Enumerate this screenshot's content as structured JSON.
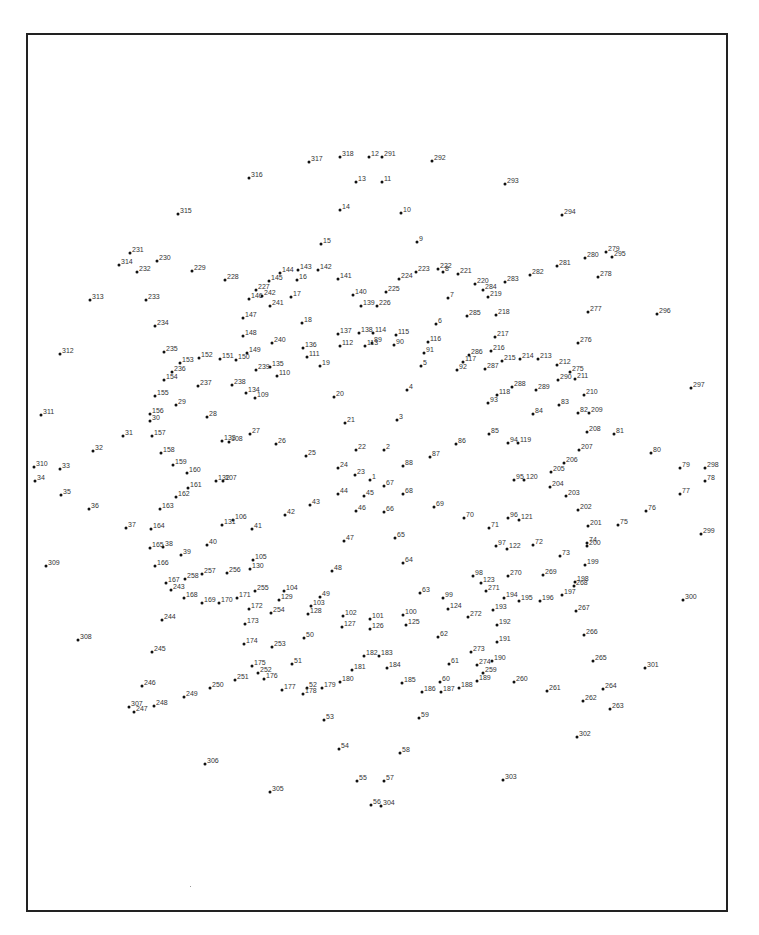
{
  "page": {
    "type": "dot-to-dot puzzle",
    "frame": {
      "left": 26,
      "top": 33,
      "right": 726,
      "bottom": 910
    }
  },
  "points": [
    [
      1,
      370,
      480
    ],
    [
      2,
      384,
      450
    ],
    [
      3,
      397,
      420
    ],
    [
      4,
      407,
      390
    ],
    [
      5,
      421,
      366
    ],
    [
      6,
      436,
      324
    ],
    [
      7,
      448,
      298
    ],
    [
      8,
      443,
      272
    ],
    [
      9,
      417,
      242
    ],
    [
      10,
      401,
      213
    ],
    [
      11,
      382,
      182
    ],
    [
      12,
      369,
      157
    ],
    [
      13,
      356,
      182
    ],
    [
      14,
      340,
      210
    ],
    [
      15,
      321,
      244
    ],
    [
      16,
      297,
      280
    ],
    [
      17,
      291,
      297
    ],
    [
      18,
      302,
      323
    ],
    [
      19,
      320,
      366
    ],
    [
      20,
      334,
      397
    ],
    [
      21,
      345,
      423
    ],
    [
      22,
      356,
      450
    ],
    [
      23,
      355,
      475
    ],
    [
      24,
      338,
      468
    ],
    [
      25,
      306,
      456
    ],
    [
      26,
      276,
      444
    ],
    [
      27,
      250,
      434
    ],
    [
      28,
      207,
      417
    ],
    [
      29,
      176,
      405
    ],
    [
      30,
      150,
      421
    ],
    [
      31,
      123,
      436
    ],
    [
      32,
      93,
      451
    ],
    [
      33,
      60,
      469
    ],
    [
      34,
      35,
      481
    ],
    [
      35,
      61,
      495
    ],
    [
      36,
      89,
      509
    ],
    [
      37,
      126,
      528
    ],
    [
      38,
      163,
      547
    ],
    [
      39,
      181,
      555
    ],
    [
      40,
      207,
      545
    ],
    [
      41,
      252,
      529
    ],
    [
      42,
      285,
      515
    ],
    [
      43,
      310,
      505
    ],
    [
      44,
      338,
      494
    ],
    [
      45,
      364,
      496
    ],
    [
      46,
      356,
      511
    ],
    [
      47,
      344,
      541
    ],
    [
      48,
      332,
      571
    ],
    [
      49,
      320,
      597
    ],
    [
      50,
      304,
      638
    ],
    [
      51,
      292,
      664
    ],
    [
      52,
      307,
      688
    ],
    [
      53,
      324,
      720
    ],
    [
      54,
      339,
      749
    ],
    [
      55,
      357,
      781
    ],
    [
      56,
      371,
      805
    ],
    [
      57,
      384,
      781
    ],
    [
      58,
      400,
      753
    ],
    [
      59,
      419,
      718
    ],
    [
      60,
      440,
      682
    ],
    [
      61,
      449,
      664
    ],
    [
      62,
      438,
      637
    ],
    [
      63,
      420,
      593
    ],
    [
      64,
      403,
      563
    ],
    [
      65,
      395,
      538
    ],
    [
      66,
      384,
      512
    ],
    [
      67,
      384,
      486
    ],
    [
      68,
      403,
      494
    ],
    [
      69,
      434,
      507
    ],
    [
      70,
      464,
      518
    ],
    [
      71,
      489,
      528
    ],
    [
      72,
      533,
      545
    ],
    [
      73,
      560,
      556
    ],
    [
      74,
      587,
      543
    ],
    [
      75,
      618,
      525
    ],
    [
      76,
      646,
      511
    ],
    [
      77,
      680,
      494
    ],
    [
      78,
      705,
      481
    ],
    [
      79,
      680,
      468
    ],
    [
      80,
      651,
      453
    ],
    [
      81,
      614,
      434
    ],
    [
      82,
      578,
      413
    ],
    [
      83,
      559,
      405
    ],
    [
      84,
      533,
      414
    ],
    [
      85,
      489,
      434
    ],
    [
      86,
      456,
      444
    ],
    [
      87,
      430,
      457
    ],
    [
      88,
      403,
      466
    ],
    [
      89,
      372,
      343
    ],
    [
      90,
      394,
      345
    ],
    [
      91,
      424,
      353
    ],
    [
      92,
      457,
      370
    ],
    [
      93,
      488,
      403
    ],
    [
      94,
      508,
      443
    ],
    [
      95,
      514,
      480
    ],
    [
      96,
      508,
      518
    ],
    [
      97,
      496,
      546
    ],
    [
      98,
      473,
      576
    ],
    [
      99,
      443,
      598
    ],
    [
      100,
      403,
      615
    ],
    [
      101,
      370,
      619
    ],
    [
      102,
      343,
      616
    ],
    [
      103,
      311,
      606
    ],
    [
      104,
      284,
      591
    ],
    [
      105,
      253,
      560
    ],
    [
      106,
      233,
      520
    ],
    [
      107,
      223,
      481
    ],
    [
      108,
      229,
      442
    ],
    [
      109,
      255,
      398
    ],
    [
      110,
      277,
      376
    ],
    [
      111,
      307,
      357
    ],
    [
      112,
      340,
      346
    ],
    [
      113,
      365,
      346
    ],
    [
      114,
      373,
      333
    ],
    [
      115,
      396,
      335
    ],
    [
      116,
      428,
      342
    ],
    [
      117,
      463,
      362
    ],
    [
      118,
      497,
      395
    ],
    [
      119,
      518,
      443
    ],
    [
      120,
      524,
      480
    ],
    [
      121,
      519,
      520
    ],
    [
      122,
      507,
      549
    ],
    [
      123,
      481,
      583
    ],
    [
      124,
      448,
      609
    ],
    [
      125,
      406,
      625
    ],
    [
      126,
      370,
      629
    ],
    [
      127,
      342,
      627
    ],
    [
      128,
      308,
      614
    ],
    [
      129,
      279,
      600
    ],
    [
      130,
      250,
      569
    ],
    [
      131,
      222,
      525
    ],
    [
      132,
      216,
      481
    ],
    [
      133,
      222,
      441
    ],
    [
      134,
      246,
      393
    ],
    [
      135,
      270,
      367
    ],
    [
      136,
      303,
      348
    ],
    [
      137,
      338,
      334
    ],
    [
      138,
      359,
      333
    ],
    [
      139,
      361,
      306
    ],
    [
      140,
      353,
      295
    ],
    [
      141,
      338,
      279
    ],
    [
      142,
      318,
      270
    ],
    [
      143,
      298,
      270
    ],
    [
      144,
      280,
      273
    ],
    [
      145,
      269,
      281
    ],
    [
      146,
      249,
      299
    ],
    [
      147,
      243,
      318
    ],
    [
      148,
      243,
      336
    ],
    [
      149,
      247,
      353
    ],
    [
      150,
      236,
      360
    ],
    [
      151,
      220,
      359
    ],
    [
      152,
      199,
      358
    ],
    [
      153,
      180,
      363
    ],
    [
      154,
      164,
      380
    ],
    [
      155,
      155,
      396
    ],
    [
      156,
      150,
      414
    ],
    [
      157,
      152,
      436
    ],
    [
      158,
      161,
      453
    ],
    [
      159,
      173,
      465
    ],
    [
      160,
      187,
      473
    ],
    [
      161,
      188,
      488
    ],
    [
      162,
      176,
      497
    ],
    [
      163,
      160,
      509
    ],
    [
      164,
      151,
      529
    ],
    [
      165,
      150,
      548
    ],
    [
      166,
      155,
      566
    ],
    [
      167,
      166,
      583
    ],
    [
      168,
      184,
      598
    ],
    [
      169,
      202,
      603
    ],
    [
      170,
      219,
      603
    ],
    [
      171,
      237,
      598
    ],
    [
      172,
      249,
      609
    ],
    [
      173,
      245,
      624
    ],
    [
      174,
      244,
      644
    ],
    [
      175,
      252,
      666
    ],
    [
      176,
      264,
      679
    ],
    [
      177,
      282,
      690
    ],
    [
      178,
      303,
      694
    ],
    [
      179,
      322,
      688
    ],
    [
      180,
      340,
      682
    ],
    [
      181,
      352,
      670
    ],
    [
      182,
      364,
      656
    ],
    [
      183,
      379,
      656
    ],
    [
      184,
      387,
      668
    ],
    [
      185,
      402,
      683
    ],
    [
      186,
      422,
      692
    ],
    [
      187,
      441,
      692
    ],
    [
      188,
      459,
      688
    ],
    [
      189,
      477,
      681
    ],
    [
      190,
      492,
      661
    ],
    [
      191,
      497,
      642
    ],
    [
      192,
      497,
      625
    ],
    [
      193,
      493,
      610
    ],
    [
      194,
      504,
      598
    ],
    [
      195,
      519,
      601
    ],
    [
      196,
      540,
      601
    ],
    [
      197,
      562,
      595
    ],
    [
      198,
      575,
      582
    ],
    [
      199,
      585,
      565
    ],
    [
      200,
      587,
      546
    ],
    [
      201,
      588,
      526
    ],
    [
      202,
      578,
      510
    ],
    [
      203,
      566,
      496
    ],
    [
      204,
      550,
      487
    ],
    [
      205,
      551,
      472
    ],
    [
      206,
      564,
      463
    ],
    [
      207,
      579,
      450
    ],
    [
      208,
      587,
      432
    ],
    [
      209,
      589,
      413
    ],
    [
      210,
      584,
      395
    ],
    [
      211,
      575,
      379
    ],
    [
      212,
      557,
      365
    ],
    [
      213,
      538,
      359
    ],
    [
      214,
      520,
      359
    ],
    [
      215,
      502,
      361
    ],
    [
      216,
      491,
      351
    ],
    [
      217,
      495,
      337
    ],
    [
      218,
      496,
      315
    ],
    [
      219,
      488,
      297
    ],
    [
      220,
      475,
      284
    ],
    [
      221,
      458,
      274
    ],
    [
      222,
      438,
      269
    ],
    [
      223,
      416,
      272
    ],
    [
      224,
      399,
      279
    ],
    [
      225,
      386,
      292
    ],
    [
      226,
      377,
      306
    ],
    [
      227,
      256,
      290
    ],
    [
      228,
      225,
      280
    ],
    [
      229,
      192,
      271
    ],
    [
      230,
      157,
      261
    ],
    [
      231,
      130,
      253
    ],
    [
      232,
      137,
      272
    ],
    [
      233,
      146,
      300
    ],
    [
      234,
      155,
      326
    ],
    [
      235,
      164,
      352
    ],
    [
      236,
      172,
      372
    ],
    [
      237,
      198,
      386
    ],
    [
      238,
      232,
      385
    ],
    [
      239,
      256,
      370
    ],
    [
      240,
      272,
      343
    ],
    [
      241,
      270,
      306
    ],
    [
      242,
      262,
      296
    ],
    [
      243,
      171,
      590
    ],
    [
      244,
      162,
      620
    ],
    [
      245,
      152,
      652
    ],
    [
      246,
      142,
      686
    ],
    [
      247,
      134,
      712
    ],
    [
      248,
      154,
      706
    ],
    [
      249,
      184,
      697
    ],
    [
      250,
      210,
      688
    ],
    [
      251,
      235,
      680
    ],
    [
      252,
      258,
      673
    ],
    [
      253,
      272,
      647
    ],
    [
      254,
      271,
      613
    ],
    [
      255,
      255,
      591
    ],
    [
      256,
      227,
      573
    ],
    [
      257,
      202,
      574
    ],
    [
      258,
      185,
      579
    ],
    [
      259,
      483,
      673
    ],
    [
      260,
      514,
      682
    ],
    [
      261,
      547,
      691
    ],
    [
      262,
      583,
      701
    ],
    [
      263,
      610,
      709
    ],
    [
      264,
      603,
      689
    ],
    [
      265,
      593,
      661
    ],
    [
      266,
      584,
      635
    ],
    [
      267,
      576,
      611
    ],
    [
      268,
      574,
      586
    ],
    [
      269,
      543,
      575
    ],
    [
      270,
      508,
      576
    ],
    [
      271,
      486,
      591
    ],
    [
      272,
      468,
      617
    ],
    [
      273,
      471,
      652
    ],
    [
      274,
      477,
      665
    ],
    [
      275,
      570,
      372
    ],
    [
      276,
      578,
      343
    ],
    [
      277,
      588,
      312
    ],
    [
      278,
      598,
      277
    ],
    [
      279,
      606,
      252
    ],
    [
      280,
      585,
      258
    ],
    [
      281,
      557,
      266
    ],
    [
      282,
      530,
      275
    ],
    [
      283,
      505,
      282
    ],
    [
      284,
      483,
      290
    ],
    [
      285,
      467,
      316
    ],
    [
      286,
      469,
      355
    ],
    [
      287,
      485,
      369
    ],
    [
      288,
      512,
      387
    ],
    [
      289,
      536,
      390
    ],
    [
      290,
      558,
      380
    ],
    [
      291,
      382,
      157
    ],
    [
      292,
      432,
      161
    ],
    [
      293,
      505,
      184
    ],
    [
      294,
      562,
      215
    ],
    [
      295,
      612,
      257
    ],
    [
      296,
      657,
      314
    ],
    [
      297,
      691,
      388
    ],
    [
      298,
      705,
      468
    ],
    [
      299,
      701,
      534
    ],
    [
      300,
      683,
      600
    ],
    [
      301,
      645,
      668
    ],
    [
      302,
      577,
      737
    ],
    [
      303,
      503,
      780
    ],
    [
      304,
      381,
      806
    ],
    [
      305,
      270,
      792
    ],
    [
      306,
      205,
      764
    ],
    [
      307,
      129,
      707
    ],
    [
      308,
      78,
      640
    ],
    [
      309,
      46,
      566
    ],
    [
      310,
      34,
      467
    ],
    [
      311,
      41,
      415
    ],
    [
      312,
      60,
      354
    ],
    [
      313,
      90,
      300
    ],
    [
      314,
      119,
      265
    ],
    [
      315,
      178,
      214
    ],
    [
      316,
      249,
      178
    ],
    [
      317,
      309,
      162
    ],
    [
      318,
      340,
      157
    ]
  ]
}
